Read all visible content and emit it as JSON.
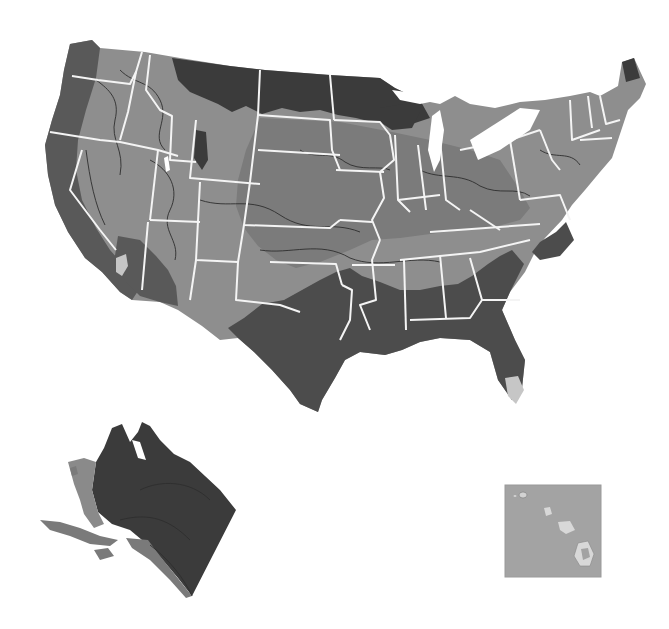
{
  "map": {
    "type": "thematic-choropleth",
    "subject": "United States (contiguous), Alaska inset, Hawaii inset",
    "legend_visible": false,
    "text_labels_visible": false,
    "shade_classes": [
      {
        "name": "very-dark",
        "color": "#3b3b3b"
      },
      {
        "name": "dark",
        "color": "#595959"
      },
      {
        "name": "medium",
        "color": "#7b7b7b"
      },
      {
        "name": "light",
        "color": "#939393"
      },
      {
        "name": "very-light",
        "color": "#c6c6c6"
      }
    ],
    "border_color": "#f4f4f4",
    "contour_color": "#2e2e2e",
    "background_color": "#ffffff",
    "insets": [
      {
        "name": "alaska",
        "position": "bottom-left"
      },
      {
        "name": "hawaii",
        "position": "bottom-right",
        "framed": true,
        "frame_fill": "#a3a3a3"
      }
    ]
  }
}
